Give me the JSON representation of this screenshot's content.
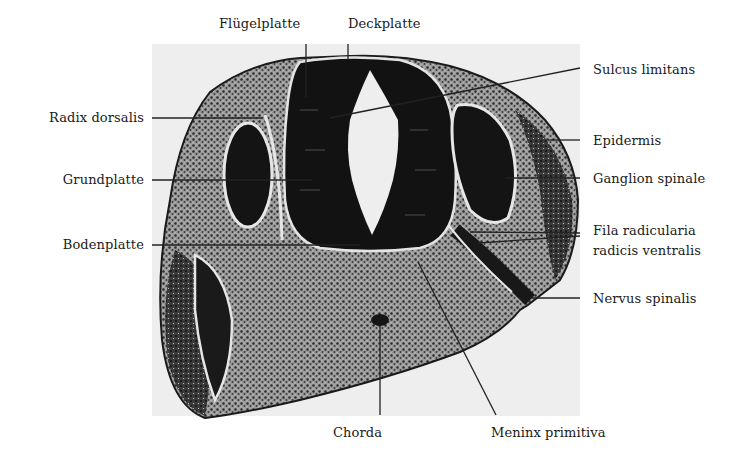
{
  "figure": {
    "type": "histological cross-section of embryonic spinal cord",
    "labels": {
      "top": [
        {
          "id": "fluegelplatte",
          "text": "Flügelplatte"
        },
        {
          "id": "deckplatte",
          "text": "Deckplatte"
        }
      ],
      "left": [
        {
          "id": "radix-dorsalis",
          "text": "Radix dorsalis"
        },
        {
          "id": "grundplatte",
          "text": "Grundplatte"
        },
        {
          "id": "bodenplatte",
          "text": "Bodenplatte"
        }
      ],
      "right": [
        {
          "id": "sulcus-limitans",
          "text": "Sulcus limitans"
        },
        {
          "id": "epidermis",
          "text": "Epidermis"
        },
        {
          "id": "ganglion-spinale",
          "text": "Ganglion spinale"
        },
        {
          "id": "fila-radicularia",
          "text": "Fila radicularia"
        },
        {
          "id": "radicis-ventralis",
          "text": "radicis  ventralis"
        },
        {
          "id": "nervus-spinalis",
          "text": "Nervus spinalis"
        }
      ],
      "bottom": [
        {
          "id": "chorda",
          "text": "Chorda"
        },
        {
          "id": "meninx-primitiva",
          "text": "Meninx primitiva"
        }
      ]
    },
    "colors": {
      "background": "#ffffff",
      "photo_background": "#eeeeee",
      "tissue_dark": "#141414",
      "tissue_mid": "#5a5a5a",
      "tissue_light": "#d8d8d8",
      "leader_line": "#222222",
      "text": "#1a1a1a"
    }
  }
}
